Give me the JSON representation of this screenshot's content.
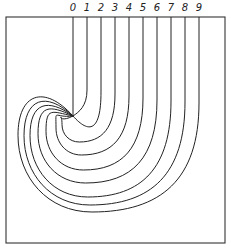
{
  "diagram": {
    "title": "",
    "frame": {
      "x": 6,
      "y": 17,
      "width": 219,
      "height": 226
    },
    "convergence_point": {
      "x": 73,
      "y": 116
    },
    "lines": [
      {
        "label": "0",
        "x": 73,
        "bend_y": 116,
        "bottom_y": 116,
        "left_x": 73
      },
      {
        "label": "1",
        "x": 87,
        "bend_y": 90,
        "bottom_y": 120,
        "left_x": 73
      },
      {
        "label": "2",
        "x": 101,
        "bend_y": 92,
        "bottom_y": 130,
        "left_x": 68
      },
      {
        "label": "3",
        "x": 115,
        "bend_y": 94,
        "bottom_y": 142,
        "left_x": 62
      },
      {
        "label": "4",
        "x": 129,
        "bend_y": 96,
        "bottom_y": 155,
        "left_x": 56
      },
      {
        "label": "5",
        "x": 143,
        "bend_y": 98,
        "bottom_y": 170,
        "left_x": 46
      },
      {
        "label": "6",
        "x": 157,
        "bend_y": 100,
        "bottom_y": 183,
        "left_x": 38
      },
      {
        "label": "7",
        "x": 171,
        "bend_y": 101,
        "bottom_y": 197,
        "left_x": 30
      },
      {
        "label": "8",
        "x": 185,
        "bend_y": 102,
        "bottom_y": 205,
        "left_x": 24
      },
      {
        "label": "9",
        "x": 199,
        "bend_y": 103,
        "bottom_y": 212,
        "left_x": 18
      }
    ],
    "label_y": 11,
    "stroke_color": "#222222",
    "background": "#ffffff"
  }
}
